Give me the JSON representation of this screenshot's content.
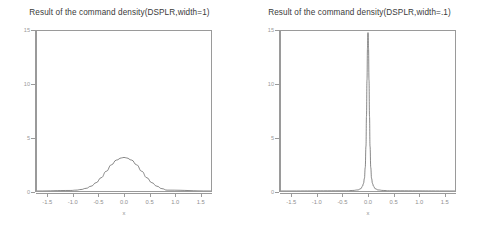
{
  "figure": {
    "background": "#ffffff",
    "axis_color": "#9a9a9a",
    "curve_color": "#555555",
    "text_color": "#3a3a3a"
  },
  "chart_data": [
    {
      "type": "line",
      "panel": "left",
      "title": "Result of the command density(DSPLR,width=1)",
      "xlabel": "x",
      "ylabel": "",
      "xlim": [
        -1.72,
        1.72
      ],
      "ylim": [
        0,
        15
      ],
      "grid": false,
      "legend": "none",
      "xticks": [
        -1.5,
        -1.0,
        -0.5,
        0.0,
        0.5,
        1.0,
        1.5
      ],
      "xticklabels": [
        "-1.5",
        "-1.0",
        "-0.5",
        "0.0",
        "0.5",
        "1.0",
        "1.5"
      ],
      "yticks": [
        0,
        5,
        10,
        15
      ],
      "yticklabels": [
        "0",
        "5",
        "10",
        "15"
      ],
      "series": [
        {
          "name": "density(DSPLR, width=1)",
          "x": [
            -1.05,
            -0.95,
            -0.85,
            -0.75,
            -0.65,
            -0.55,
            -0.45,
            -0.35,
            -0.25,
            -0.15,
            -0.05,
            0.0,
            0.05,
            0.15,
            0.25,
            0.35,
            0.45,
            0.55,
            0.65,
            0.75,
            0.85
          ],
          "values": [
            0.05,
            0.08,
            0.14,
            0.25,
            0.45,
            0.78,
            1.25,
            1.85,
            2.45,
            2.9,
            3.1,
            3.15,
            3.1,
            2.9,
            2.45,
            1.85,
            1.25,
            0.78,
            0.45,
            0.22,
            0.08
          ]
        }
      ]
    },
    {
      "type": "line",
      "panel": "right",
      "title": "Result of the command density(DSPLR,width=.1)",
      "xlabel": "x",
      "ylabel": "",
      "xlim": [
        -1.72,
        1.72
      ],
      "ylim": [
        0,
        15
      ],
      "grid": false,
      "legend": "none",
      "xticks": [
        -1.5,
        -1.0,
        -0.5,
        0.0,
        0.5,
        1.0,
        1.5
      ],
      "xticklabels": [
        "-1.5",
        "-1.0",
        "-0.5",
        "0.0",
        "0.5",
        "1.0",
        "1.5"
      ],
      "yticks": [
        0,
        5,
        10,
        15
      ],
      "yticklabels": [
        "0",
        "5",
        "10",
        "15"
      ],
      "series": [
        {
          "name": "density(DSPLR, width=.1)",
          "x": [
            -0.42,
            -0.3,
            -0.2,
            -0.14,
            -0.11,
            -0.09,
            -0.07,
            -0.055,
            -0.04,
            -0.03,
            -0.02,
            -0.01,
            0.0,
            0.01,
            0.02,
            0.03,
            0.04,
            0.055,
            0.07,
            0.09,
            0.11,
            0.14,
            0.2,
            0.3,
            0.42
          ],
          "values": [
            0.02,
            0.05,
            0.1,
            0.22,
            0.45,
            0.7,
            1.2,
            2.2,
            4.2,
            7.0,
            10.4,
            13.4,
            14.85,
            13.4,
            10.4,
            7.0,
            4.2,
            2.2,
            1.2,
            0.7,
            0.45,
            0.22,
            0.1,
            0.05,
            0.02
          ]
        }
      ]
    }
  ]
}
